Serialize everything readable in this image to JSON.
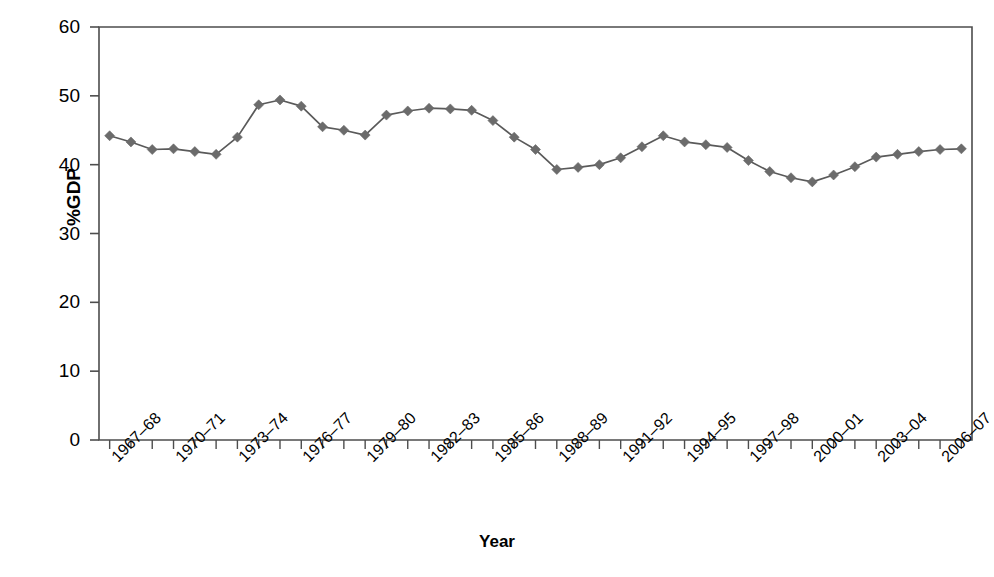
{
  "chart_data": {
    "type": "line",
    "title": "",
    "xlabel": "Year",
    "ylabel": "%GDP",
    "ylim": [
      0,
      60
    ],
    "ytick_values": [
      0,
      10,
      20,
      30,
      40,
      50,
      60
    ],
    "ytick_labels": [
      "0",
      "10",
      "20",
      "30",
      "40",
      "50",
      "60"
    ],
    "grid": false,
    "legend": "none",
    "marker": "diamond",
    "series_color": "#6b6b6b",
    "line_color": "#5a5a5a",
    "axis_color": "#4d4d4d",
    "categories": [
      "1967–68",
      "1968–69",
      "1969–70",
      "1970–71",
      "1971–72",
      "1972–73",
      "1973–74",
      "1974–75",
      "1975–76",
      "1976–77",
      "1977–78",
      "1978–79",
      "1979–80",
      "1980–81",
      "1981–82",
      "1982–83",
      "1983–84",
      "1984–85",
      "1985–86",
      "1986–87",
      "1987–88",
      "1988–89",
      "1989–90",
      "1990–91",
      "1991–92",
      "1992–93",
      "1993–94",
      "1994–95",
      "1995–96",
      "1996–97",
      "1997–98",
      "1998–99",
      "1999–00",
      "2000–01",
      "2001–02",
      "2002–03",
      "2003–04",
      "2004–05",
      "2005–06",
      "2006–07",
      "2007–08"
    ],
    "xtick_labels": [
      "1967–68",
      "1970–71",
      "1973–74",
      "1976–77",
      "1979–80",
      "1982–83",
      "1985–86",
      "1988–89",
      "1991–92",
      "1994–95",
      "1997–98",
      "2000–01",
      "2003–04",
      "2006–07"
    ],
    "xtick_indices": [
      0,
      3,
      6,
      9,
      12,
      15,
      18,
      21,
      24,
      27,
      30,
      33,
      36,
      39
    ],
    "values": [
      44.2,
      43.3,
      42.2,
      42.3,
      41.9,
      41.5,
      44.0,
      48.7,
      49.4,
      48.5,
      45.5,
      45.0,
      44.3,
      47.2,
      47.8,
      48.2,
      48.1,
      47.9,
      46.4,
      44.0,
      42.2,
      39.3,
      39.6,
      40.0,
      41.0,
      42.6,
      44.2,
      43.3,
      42.9,
      42.5,
      40.6,
      39.0,
      38.1,
      37.5,
      38.5,
      39.7,
      41.1,
      41.5,
      41.9,
      42.2,
      42.3
    ],
    "series": [
      {
        "name": "%GDP",
        "values": [
          44.2,
          43.3,
          42.2,
          42.3,
          41.9,
          41.5,
          44.0,
          48.7,
          49.4,
          48.5,
          45.5,
          45.0,
          44.3,
          47.2,
          47.8,
          48.2,
          48.1,
          47.9,
          46.4,
          44.0,
          42.2,
          39.3,
          39.6,
          40.0,
          41.0,
          42.6,
          44.2,
          43.3,
          42.9,
          42.5,
          40.6,
          39.0,
          38.1,
          37.5,
          38.5,
          39.7,
          41.1,
          41.5,
          41.9,
          42.2,
          42.3
        ]
      }
    ]
  }
}
